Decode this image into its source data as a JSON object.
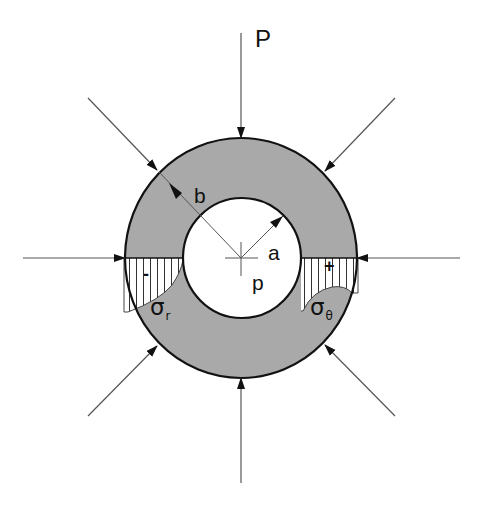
{
  "diagram": {
    "type": "thick-walled cylinder stress diagram",
    "colors": {
      "wall_fill": "#a9a9a9",
      "outline": "#111111",
      "load_line": "#555555",
      "hatch": "#333333",
      "background": "#ffffff"
    },
    "geometry": {
      "center": [
        241,
        258
      ],
      "outer_radius": {
        "rx": 116,
        "ry": 120
      },
      "inner_radius": {
        "rx": 59,
        "ry": 60
      }
    },
    "labels": {
      "external_load": "P",
      "outer_radius": "b",
      "inner_radius": "a",
      "internal_pressure": "p",
      "radial_stress": "σ",
      "radial_stress_sub": "r",
      "hoop_stress": "σ",
      "hoop_stress_sub": "θ",
      "radial_sign": "-",
      "hoop_sign": "+"
    },
    "load_arrows": [
      {
        "direction": "top",
        "from": [
          241,
          33
        ],
        "to": [
          241,
          138
        ]
      },
      {
        "direction": "bottom",
        "from": [
          241,
          483
        ],
        "to": [
          241,
          378
        ]
      },
      {
        "direction": "left",
        "from": [
          23,
          258
        ],
        "to": [
          125,
          258
        ]
      },
      {
        "direction": "right",
        "from": [
          460,
          258
        ],
        "to": [
          357,
          258
        ]
      },
      {
        "direction": "top-left",
        "from": [
          88,
          98
        ],
        "to": [
          159,
          172
        ]
      },
      {
        "direction": "top-right",
        "from": [
          395,
          98
        ],
        "to": [
          323,
          173
        ]
      },
      {
        "direction": "bottom-left",
        "from": [
          88,
          416
        ],
        "to": [
          158,
          345
        ]
      },
      {
        "direction": "bottom-right",
        "from": [
          395,
          416
        ],
        "to": [
          324,
          344
        ]
      }
    ],
    "stress_distributions": [
      {
        "name": "radial stress",
        "symbol": "σr",
        "sign": "-",
        "side": "left"
      },
      {
        "name": "hoop stress",
        "symbol": "σθ",
        "sign": "+",
        "side": "right"
      }
    ]
  }
}
